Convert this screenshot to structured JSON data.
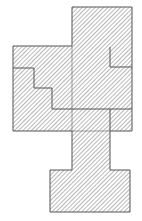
{
  "figure": {
    "canvas": {
      "width": 142,
      "height": 221,
      "background": "#ffffff"
    },
    "style": {
      "fill_hatch_color": "#9a9a9a",
      "fill_background": "#ffffff",
      "outline_color": "#555555",
      "outline_width": 1,
      "interior_line_color": "#555555",
      "interior_line_width": 1,
      "hatch_angle_degrees": 45,
      "hatch_spacing_px": 3
    },
    "shapes": [
      {
        "name": "top-rectangle",
        "role": "upper block",
        "kind": "rect",
        "x": 72,
        "y": 7,
        "width": 60,
        "height": 41
      },
      {
        "name": "main-body",
        "role": "central cross block",
        "kind": "rect",
        "x": 13,
        "y": 46,
        "width": 119,
        "height": 85
      },
      {
        "name": "neck-rectangle",
        "role": "connector stem",
        "kind": "rect",
        "x": 72,
        "y": 131,
        "width": 38,
        "height": 40
      },
      {
        "name": "bottom-rectangle",
        "role": "lower block",
        "kind": "rect",
        "x": 50,
        "y": 170,
        "width": 80,
        "height": 42
      }
    ],
    "outline_path": "M 72 7 L 132 7 L 132 131 L 110 131 L 110 170 L 130 170 L 130 212 L 50 212 L 50 170 L 72 170 L 72 131 L 13 131 L 13 46 L 72 46 Z",
    "interior_lines": [
      {
        "name": "staircase-divider",
        "description": "descending three-step staircase across the left of the main body",
        "path": "M 13 68 L 34 68 L 34 88 L 52 88 L 52 109 L 132 109"
      },
      {
        "name": "upper-right-notch",
        "description": "small rectangle cell at the upper right of the main body",
        "path": "M 110 47 L 110 67 L 132 67"
      },
      {
        "name": "lower-right-notch",
        "description": "small rectangle cell at the lower right of the main body",
        "path": "M 110 109 L 110 131"
      },
      {
        "name": "top-block-seam",
        "description": "seam where the top rectangle meets the main body",
        "path": "M 72 46 L 72 131"
      },
      {
        "name": "main-body-bottom-seam",
        "description": "seam where the neck meets the main body bottom edge",
        "path": "M 110 131 L 72 131"
      }
    ],
    "vertices": [
      {
        "name": "v1",
        "x": 72,
        "y": 7
      },
      {
        "name": "v2",
        "x": 132,
        "y": 7
      },
      {
        "name": "v3",
        "x": 132,
        "y": 131
      },
      {
        "name": "v4",
        "x": 110,
        "y": 131
      },
      {
        "name": "v5",
        "x": 110,
        "y": 170
      },
      {
        "name": "v6",
        "x": 130,
        "y": 170
      },
      {
        "name": "v7",
        "x": 130,
        "y": 212
      },
      {
        "name": "v8",
        "x": 50,
        "y": 212
      },
      {
        "name": "v9",
        "x": 50,
        "y": 170
      },
      {
        "name": "v10",
        "x": 72,
        "y": 170
      },
      {
        "name": "v11",
        "x": 72,
        "y": 131
      },
      {
        "name": "v12",
        "x": 13,
        "y": 131
      },
      {
        "name": "v13",
        "x": 13,
        "y": 46
      },
      {
        "name": "v14",
        "x": 72,
        "y": 46
      }
    ]
  }
}
